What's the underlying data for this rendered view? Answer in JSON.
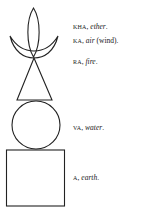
{
  "diagram": {
    "type": "elemental-stupa-symbol",
    "stroke_color": "#222222",
    "elements": [
      {
        "shape": "leaf-flame",
        "syllable": "KHA",
        "element": "ether",
        "note": ""
      },
      {
        "shape": "crescent",
        "syllable": "KA",
        "element": "air",
        "note": "(wind)."
      },
      {
        "shape": "triangle",
        "syllable": "RA",
        "element": "fire",
        "note": ""
      },
      {
        "shape": "circle",
        "syllable": "VA",
        "element": "water",
        "note": ""
      },
      {
        "shape": "square",
        "syllable": "A",
        "element": "earth",
        "note": ""
      }
    ]
  },
  "labels": {
    "kha": {
      "syllable": "KHA",
      "sep": ", ",
      "element": "ether",
      "end": "."
    },
    "ka": {
      "syllable": "KA",
      "sep": ", ",
      "element": "air",
      "end": " (wind)."
    },
    "ra": {
      "syllable": "RA",
      "sep": ", ",
      "element": "fire",
      "end": "."
    },
    "va": {
      "syllable": "VA",
      "sep": ", ",
      "element": "water",
      "end": "."
    },
    "a": {
      "syllable": "A",
      "sep": ", ",
      "element": "earth",
      "end": "."
    }
  }
}
